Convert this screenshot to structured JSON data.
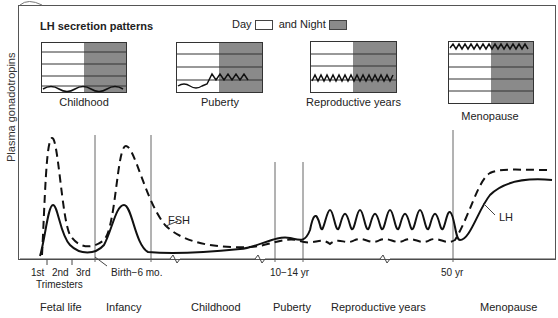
{
  "figure": {
    "y_axis_label": "Plasma gonadotropins",
    "inset_title": "LH secretion patterns",
    "legend": {
      "day_label": "Day",
      "night_label": "and Night",
      "day_color": "#ffffff",
      "night_color": "#8a8a8a"
    },
    "insets": [
      {
        "label": "Childhood",
        "pattern": "low waves day and night"
      },
      {
        "label": "Puberty",
        "pattern": "low by day, pulsatile rise at night"
      },
      {
        "label": "Reproductive years",
        "pattern": "mid-level pulses day and night"
      },
      {
        "label": "Menopause",
        "pattern": "high pulses day and night"
      }
    ],
    "curves": {
      "fsh_label": "FSH",
      "lh_label": "LH"
    },
    "ticks": {
      "trimesters": [
        "1st",
        "2nd",
        "3rd"
      ],
      "trimesters_caption": "Trimesters",
      "birth": "Birth−6 mo.",
      "puberty": "10−14 yr",
      "menopause": "50 yr"
    },
    "phases": [
      "Fetal life",
      "Infancy",
      "Childhood",
      "Puberty",
      "Reproductive years",
      "Menopause"
    ]
  }
}
